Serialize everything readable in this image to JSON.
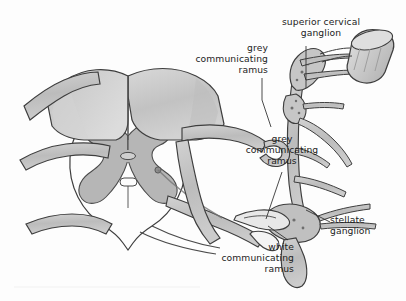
{
  "figure": {
    "background_color": "#fdfdfd",
    "ink_color": "#3b3b3b",
    "tissue_fill_light": "#f2f2f2",
    "tissue_fill_mid": "#c9c9c9",
    "tissue_fill_dark": "#a8a8a8",
    "grey_matter_fill": "#b6b6b6"
  },
  "labels": {
    "superior_cervical_ganglion": {
      "name": "superior cervical ganglion",
      "lines": [
        "superior cervical",
        "ganglion"
      ],
      "align": "center"
    },
    "grey_communicating_ramus_upper": {
      "name": "grey communicating ramus",
      "lines": [
        "grey",
        "communicating",
        "ramus"
      ],
      "align": "right"
    },
    "grey_communicating_ramus_lower": {
      "name": "grey communicating ramus",
      "lines": [
        "grey",
        "communicating",
        "ramus"
      ],
      "align": "center"
    },
    "white_communicating_ramus": {
      "name": "white communicating ramus",
      "lines": [
        "white",
        "communicating",
        "ramus"
      ],
      "align": "right"
    },
    "stellate_ganglion": {
      "name": "stellate ganglion",
      "lines": [
        "stellate",
        "ganglion"
      ],
      "align": "left"
    }
  },
  "structures": [
    {
      "id": "vertebral-body",
      "name": "vertebral body"
    },
    {
      "id": "spinal-cord",
      "name": "spinal cord cross-section"
    },
    {
      "id": "grey-matter",
      "name": "grey matter butterfly"
    },
    {
      "id": "central-canal",
      "name": "central canal"
    },
    {
      "id": "dorsal-root",
      "name": "dorsal root"
    },
    {
      "id": "ventral-root",
      "name": "ventral root"
    },
    {
      "id": "spinal-nerve",
      "name": "spinal nerve"
    },
    {
      "id": "sympathetic-trunk",
      "name": "sympathetic trunk"
    },
    {
      "id": "superior-cervical-ganglion",
      "name": "superior cervical ganglion"
    },
    {
      "id": "stellate-ganglion",
      "name": "stellate ganglion"
    },
    {
      "id": "internal-carotid-nerve",
      "name": "internal carotid nerve stump"
    },
    {
      "id": "grey-ramus",
      "name": "grey communicating ramus"
    },
    {
      "id": "white-ramus",
      "name": "white communicating ramus"
    }
  ]
}
